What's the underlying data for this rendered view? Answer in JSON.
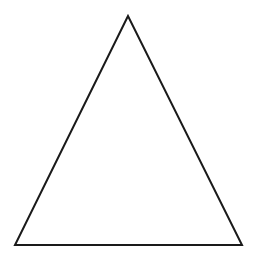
{
  "diagram": {
    "shape": "triangle",
    "fill": "#ffffff",
    "stroke": "#1a1a1a",
    "stroke_width": 2,
    "points": [
      [
        128,
        16
      ],
      [
        15,
        245
      ],
      [
        242,
        245
      ]
    ]
  }
}
